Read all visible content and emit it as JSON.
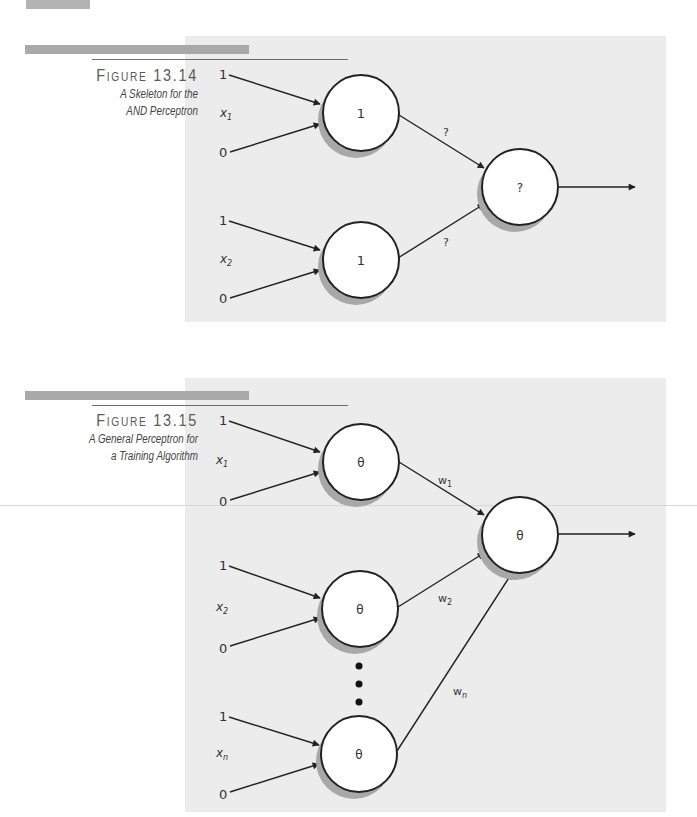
{
  "figures": [
    {
      "number": "Figure 13.14",
      "title_line1": "A Skeleton for the",
      "title_line2": "AND Perceptron",
      "inputs": [
        {
          "top_value": "1",
          "label": "x",
          "subscript": "1",
          "bottom_value": "0",
          "node_label": "1",
          "weight": "?"
        },
        {
          "top_value": "1",
          "label": "x",
          "subscript": "2",
          "bottom_value": "0",
          "node_label": "1",
          "weight": "?"
        }
      ],
      "output_node_label": "?"
    },
    {
      "number": "Figure 13.15",
      "title_line1": "A General Perceptron for",
      "title_line2": "a Training Algorithm",
      "inputs": [
        {
          "top_value": "1",
          "label": "x",
          "subscript": "1",
          "bottom_value": "0",
          "node_label": "θ",
          "weight": "w",
          "weight_subscript": "1"
        },
        {
          "top_value": "1",
          "label": "x",
          "subscript": "2",
          "bottom_value": "0",
          "node_label": "θ",
          "weight": "w",
          "weight_subscript": "2"
        },
        {
          "top_value": "1",
          "label": "x",
          "subscript": "n",
          "bottom_value": "0",
          "node_label": "θ",
          "weight": "w",
          "weight_subscript": "n"
        }
      ],
      "ellipsis": "⋮",
      "output_node_label": "θ"
    }
  ],
  "colors": {
    "panel_bg": "#ececec",
    "bar": "#a9a9a9",
    "stroke": "#222222",
    "shadow": "#a8a8a8",
    "node_fill": "#ffffff"
  }
}
